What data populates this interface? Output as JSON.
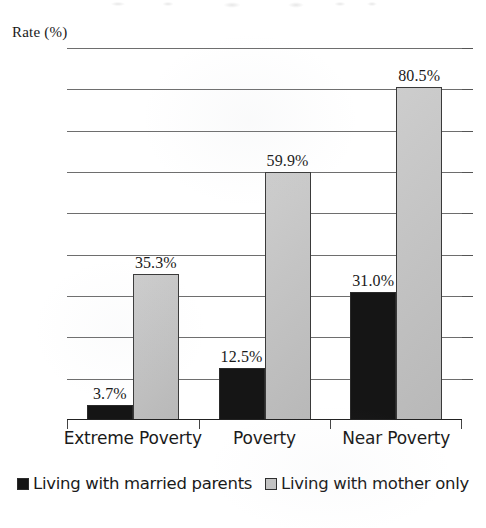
{
  "chart_data": {
    "type": "bar",
    "title": "",
    "xlabel": "",
    "ylabel": "Rate (%)",
    "ylim": [
      0,
      90
    ],
    "yticks": [
      0,
      10,
      20,
      30,
      40,
      50,
      60,
      70,
      80,
      90
    ],
    "ytick_labels": [
      "0",
      "10",
      "20",
      "30",
      "40",
      "50",
      "60",
      "70",
      "80",
      "90"
    ],
    "grid": true,
    "legend_position": "bottom-center",
    "categories": [
      "Extreme Poverty",
      "Poverty",
      "Near Poverty"
    ],
    "series": [
      {
        "name": "Living with married parents",
        "color": "#151515",
        "values": [
          3.7,
          12.5,
          31.0
        ],
        "labels": [
          "3.7%",
          "12.5%",
          "31.0%"
        ]
      },
      {
        "name": "Living with mother only",
        "color": "#c2c2c2",
        "values": [
          35.3,
          59.9,
          80.5
        ],
        "labels": [
          "35.3%",
          "59.9%",
          "80.5%"
        ]
      }
    ]
  },
  "axis": {
    "y_caption": "Rate (%)"
  },
  "legend": {
    "entries": [
      {
        "label": "Living with married parents",
        "swatch": "black-square-icon"
      },
      {
        "label": "Living with mother only",
        "swatch": "gray-square-icon"
      }
    ]
  }
}
